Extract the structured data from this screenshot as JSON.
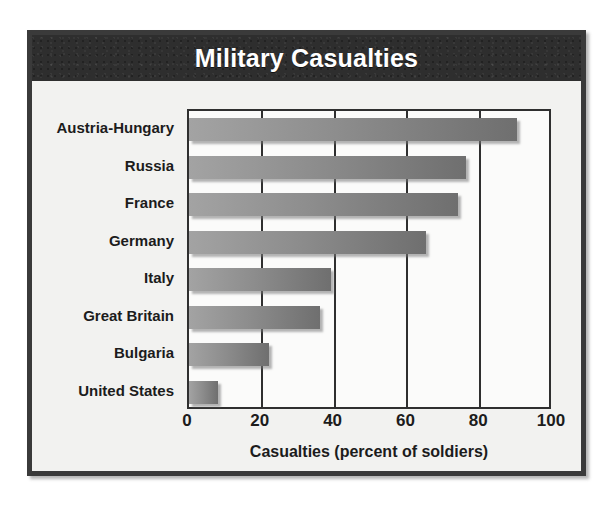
{
  "figure": {
    "title": "Military Casualties",
    "frame_color": "#3a3a3a",
    "title_bar_color": "#2e2e2e",
    "title_text_color": "#ffffff",
    "panel_background": "#f2f2f0",
    "bar_color_light": "#a3a3a3",
    "bar_color_dark": "#6f6f6f"
  },
  "chart_data": {
    "type": "bar",
    "orientation": "horizontal",
    "title": "Military Casualties",
    "xlabel": "Casualties (percent of soldiers)",
    "ylabel": "",
    "xlim": [
      0,
      100
    ],
    "xticks": [
      0,
      20,
      40,
      60,
      80,
      100
    ],
    "xtick_labels": [
      "0",
      "20",
      "40",
      "60",
      "80",
      "100"
    ],
    "grid": true,
    "legend": false,
    "categories": [
      "Austria-Hungary",
      "Russia",
      "France",
      "Germany",
      "Italy",
      "Great Britain",
      "Bulgaria",
      "United States"
    ],
    "values": [
      90,
      76,
      74,
      65,
      39,
      36,
      22,
      8
    ]
  }
}
